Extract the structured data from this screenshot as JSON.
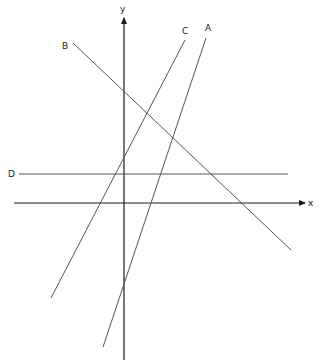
{
  "diagram": {
    "type": "coordinate-plane-lines",
    "axes": {
      "x": {
        "label": "x",
        "from": [
          14,
          203
        ],
        "to": [
          305,
          203
        ],
        "label_pos": [
          308,
          206
        ]
      },
      "y": {
        "label": "y",
        "from": [
          124,
          360
        ],
        "to": [
          124,
          18
        ],
        "label_pos": [
          120,
          12
        ]
      }
    },
    "lines": [
      {
        "name": "A",
        "from": [
          206,
          38
        ],
        "to": [
          103,
          347
        ],
        "label_pos": [
          205,
          31
        ],
        "slope": "positive, steep"
      },
      {
        "name": "B",
        "from": [
          73,
          43
        ],
        "to": [
          291,
          250
        ],
        "label_pos": [
          62,
          49
        ],
        "slope": "negative"
      },
      {
        "name": "C",
        "from": [
          185,
          40
        ],
        "to": [
          51,
          298
        ],
        "label_pos": [
          182,
          34
        ],
        "slope": "positive"
      },
      {
        "name": "D",
        "from": [
          19,
          174
        ],
        "to": [
          288,
          174
        ],
        "label_pos": [
          8,
          177
        ],
        "slope": "zero (horizontal)"
      }
    ],
    "colors": {
      "axis": "#1a1a1a",
      "line": "#555555",
      "label": "#222222",
      "background": "#ffffff"
    }
  }
}
